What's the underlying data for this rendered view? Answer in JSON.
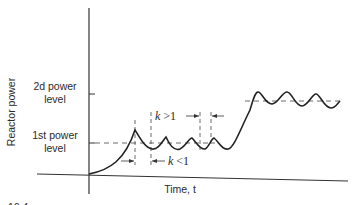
{
  "figure": {
    "y_axis_label": "Reactor power",
    "x_axis_label": "Time, t",
    "levels": [
      {
        "line1": "2d power",
        "line2": "level"
      },
      {
        "line1": "1st power",
        "line2": "level"
      }
    ],
    "annotations": {
      "k_greater": {
        "var": "k",
        "op": " >1"
      },
      "k_less": {
        "var": "k",
        "op": " <1"
      }
    },
    "caption_fragment": "16.4"
  }
}
